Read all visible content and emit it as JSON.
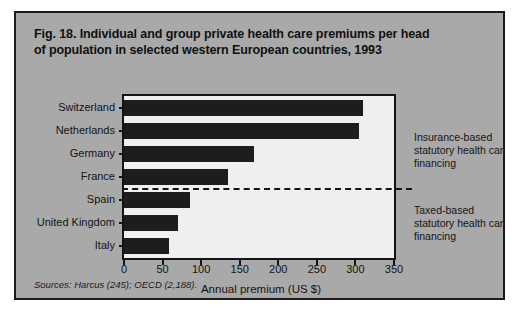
{
  "figure": {
    "title_line1": "Fig. 18. Individual and group private health care premiums per head",
    "title_line2": "of population in selected western European countries, 1993",
    "sources": "Sources: Harcus (245); OECD (2,188)."
  },
  "annotations": {
    "top": "Insurance-based statutory health care financing",
    "bottom": "Taxed-based statutory health care financing"
  },
  "chart_data": {
    "type": "bar",
    "orientation": "horizontal",
    "title": "Fig. 18. Individual and group private health care premiums per head of population in selected western European countries, 1993",
    "xlabel": "Annual premium (US $)",
    "ylabel": "",
    "xlim": [
      0,
      350
    ],
    "xticks": [
      0,
      50,
      100,
      150,
      200,
      250,
      300,
      350
    ],
    "grid": false,
    "legend": "none",
    "categories": [
      "Switzerland",
      "Netherlands",
      "Germany",
      "France",
      "Spain",
      "United Kingdom",
      "Italy"
    ],
    "values": [
      310,
      305,
      168,
      135,
      85,
      70,
      58
    ],
    "groups": [
      {
        "label": "Insurance-based statutory health care financing",
        "categories": [
          "Switzerland",
          "Netherlands",
          "Germany",
          "France"
        ]
      },
      {
        "label": "Taxed-based statutory health care financing",
        "categories": [
          "Spain",
          "United Kingdom",
          "Italy"
        ]
      }
    ],
    "divider_after": "France",
    "bar_color": "#1d1d1d"
  }
}
